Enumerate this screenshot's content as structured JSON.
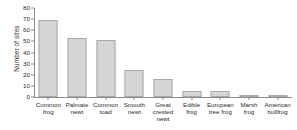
{
  "chart_data": {
    "type": "bar",
    "title": "",
    "subtitle": "",
    "xlabel": "",
    "ylabel": "Number of sites",
    "ylim": [
      0,
      80
    ],
    "ytick_values": [
      0,
      10,
      20,
      30,
      40,
      50,
      60,
      70,
      80
    ],
    "ytick_labels": [
      "0",
      "10",
      "20",
      "30",
      "40",
      "50",
      "60",
      "70",
      "80"
    ],
    "grid": false,
    "legend": false,
    "legend_position": "none",
    "categories": [
      "Common frog",
      "Palmate newt",
      "Common toad",
      "Smooth newt",
      "Great crested newt",
      "Edible frog",
      "European tree frog",
      "Marsh frog",
      "American bullfrog"
    ],
    "category_lines": [
      [
        "Common",
        "frog"
      ],
      [
        "Palmate",
        "newt"
      ],
      [
        "Common",
        "toad"
      ],
      [
        "Smooth",
        "newt"
      ],
      [
        "Great",
        "crested",
        "newt"
      ],
      [
        "Edible",
        "frog"
      ],
      [
        "European",
        "tree frog"
      ],
      [
        "Marsh",
        "frog"
      ],
      [
        "American",
        "bullfrog"
      ]
    ],
    "values": [
      69,
      53,
      51,
      24,
      16,
      5,
      5,
      1,
      1
    ],
    "bar_fill_color": "#d6d6d6",
    "bar_edge_color": "#a9a9a9",
    "axis_color": "#8c8c8c",
    "text_color": "#2b2b2b",
    "background_color": "#ffffff"
  }
}
